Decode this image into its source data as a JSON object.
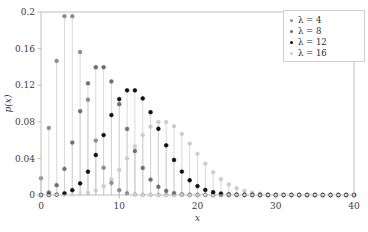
{
  "chart_data": {
    "type": "scatter",
    "plot_style": "stem",
    "title": "",
    "xlabel": "x",
    "ylabel": "p(x)",
    "xlim": [
      0,
      40
    ],
    "ylim": [
      0,
      0.2
    ],
    "xticks": [
      0,
      10,
      20,
      30,
      40
    ],
    "xtick_labels": [
      "0",
      "10",
      "20",
      "30",
      "40"
    ],
    "yticks": [
      0,
      0.04,
      0.08,
      0.12,
      0.16,
      0.2
    ],
    "ytick_labels": [
      "0",
      "0.04",
      "0.08",
      "0.12",
      "0.16",
      "0.2"
    ],
    "grid": false,
    "legend_position": "top-right",
    "x": [
      0,
      1,
      2,
      3,
      4,
      5,
      6,
      7,
      8,
      9,
      10,
      11,
      12,
      13,
      14,
      15,
      16,
      17,
      18,
      19,
      20,
      21,
      22,
      23,
      24,
      25,
      26,
      27,
      28,
      29,
      30,
      31,
      32,
      33,
      34,
      35,
      36,
      37,
      38,
      39,
      40
    ],
    "series": [
      {
        "name": "λ = 4",
        "lambda": 4,
        "color": "#8c8c8c",
        "values": [
          0.0183,
          0.0733,
          0.1465,
          0.1954,
          0.1954,
          0.1563,
          0.1042,
          0.0595,
          0.0298,
          0.0132,
          0.0053,
          0.0019,
          0.0006,
          0.0002,
          0.0001,
          0.0,
          0.0,
          0.0,
          0.0,
          0.0,
          0.0,
          0.0,
          0.0,
          0.0,
          0.0,
          0.0,
          0.0,
          0.0,
          0.0,
          0.0,
          0.0,
          0.0,
          0.0,
          0.0,
          0.0,
          0.0,
          0.0,
          0.0,
          0.0,
          0.0,
          0.0
        ]
      },
      {
        "name": "λ = 8",
        "lambda": 8,
        "color": "#6e6e6e",
        "values": [
          0.0003,
          0.0027,
          0.0107,
          0.0286,
          0.0573,
          0.0916,
          0.1221,
          0.1396,
          0.1396,
          0.1241,
          0.0993,
          0.0722,
          0.0481,
          0.0296,
          0.0169,
          0.009,
          0.0045,
          0.0021,
          0.0009,
          0.0004,
          0.0002,
          0.0001,
          0.0,
          0.0,
          0.0,
          0.0,
          0.0,
          0.0,
          0.0,
          0.0,
          0.0,
          0.0,
          0.0,
          0.0,
          0.0,
          0.0,
          0.0,
          0.0,
          0.0,
          0.0,
          0.0
        ]
      },
      {
        "name": "λ = 12",
        "lambda": 12,
        "color": "#111111",
        "values": [
          0.0,
          0.0001,
          0.0004,
          0.0018,
          0.0053,
          0.0127,
          0.0255,
          0.0437,
          0.0655,
          0.0874,
          0.1048,
          0.1144,
          0.1144,
          0.1056,
          0.0905,
          0.0724,
          0.0543,
          0.0383,
          0.0256,
          0.0161,
          0.0097,
          0.0055,
          0.003,
          0.0016,
          0.0008,
          0.0004,
          0.0002,
          0.0001,
          0.0,
          0.0,
          0.0,
          0.0,
          0.0,
          0.0,
          0.0,
          0.0,
          0.0,
          0.0,
          0.0,
          0.0,
          0.0
        ]
      },
      {
        "name": "λ = 16",
        "lambda": 16,
        "color": "#cccccc",
        "values": [
          0.0,
          0.0,
          0.0,
          0.0001,
          0.0002,
          0.0008,
          0.0021,
          0.0048,
          0.0096,
          0.0171,
          0.0274,
          0.0399,
          0.0532,
          0.0655,
          0.0748,
          0.0798,
          0.0798,
          0.0751,
          0.0668,
          0.0562,
          0.045,
          0.0343,
          0.025,
          0.0174,
          0.0116,
          0.0074,
          0.0046,
          0.0027,
          0.0015,
          0.0008,
          0.0004,
          0.0002,
          0.0001,
          0.0001,
          0.0,
          0.0,
          0.0,
          0.0,
          0.0,
          0.0,
          0.0
        ]
      }
    ]
  },
  "axes": {
    "xlabel": "x",
    "ylabel": "p(x)"
  },
  "legend": {
    "items": [
      {
        "label": "λ = 4"
      },
      {
        "label": "λ = 8"
      },
      {
        "label": "λ = 12"
      },
      {
        "label": "λ = 16"
      }
    ]
  },
  "colors": {
    "spine": "#b8b8b8",
    "stem": "#d0d0d0",
    "tick_text": "#3a3a3a",
    "legend_border": "#cfcfcf",
    "background": "#ffffff"
  }
}
